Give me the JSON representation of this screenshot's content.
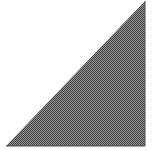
{
  "figure": {
    "shape": "right-triangle",
    "vertices": [
      [
        145,
        1
      ],
      [
        6,
        146
      ],
      [
        145,
        146
      ]
    ],
    "fill_pattern": "checkerboard-dither",
    "colors": {
      "background": "#ffffff",
      "dither_dark": "#3c3c3c",
      "dither_light": "#9a9a9a",
      "edge": "#4a4a4a"
    }
  }
}
